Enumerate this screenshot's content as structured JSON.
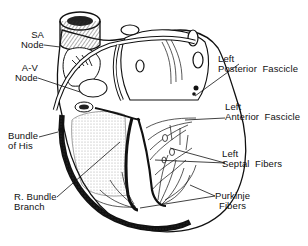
{
  "diagram": {
    "colors": {
      "ink": "#111111",
      "background": "#ffffff",
      "shade": "#888888"
    },
    "labels": {
      "sa_node": {
        "line1": "SA",
        "line2": "Node"
      },
      "av_node": {
        "line1": "A-V",
        "line2": "Node"
      },
      "bundle_of_his": {
        "line1": "Bundle",
        "line2": "of His"
      },
      "r_bundle_branch": {
        "line1": "R. Bundle",
        "line2": "Branch"
      },
      "left_posterior_fascicle": {
        "line1": "Left",
        "line2": "Posterior  Fascicle"
      },
      "left_anterior_fascicle": {
        "line1": "Left",
        "line2": "Anterior  Fascicle"
      },
      "left_septal_fibers": {
        "line1": "Left",
        "line2": "Septal  Fibers"
      },
      "purkinje_fibers": {
        "line1": "Purkinje",
        "line2": "Fibers"
      }
    }
  }
}
